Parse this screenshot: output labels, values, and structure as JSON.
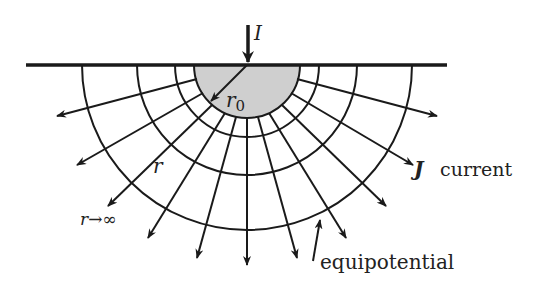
{
  "diagram": {
    "colors": {
      "line": "#1a1a1a",
      "electrode_fill": "#cfcfcf",
      "text": "#222222"
    },
    "labels": {
      "current_in": "I",
      "electrode_radius": "r",
      "electrode_radius_sub": "0",
      "radius": "r",
      "infinity": "r→∞",
      "current_density_symbol": "J",
      "current_density_word": "current",
      "equipotential": "equipotential"
    },
    "geometry": {
      "center": [
        247,
        65
      ],
      "surface_x": [
        26,
        447
      ],
      "electrode_radius_px": 53,
      "equipotential_radii_px": [
        72,
        110,
        165
      ],
      "current_arrow_tips": [
        [
          57,
          116
        ],
        [
          77,
          165
        ],
        [
          108,
          206
        ],
        [
          148,
          238
        ],
        [
          197,
          258
        ],
        [
          247,
          265
        ],
        [
          297,
          258
        ],
        [
          346,
          238
        ],
        [
          386,
          206
        ],
        [
          413,
          165
        ],
        [
          437,
          116
        ]
      ]
    }
  }
}
